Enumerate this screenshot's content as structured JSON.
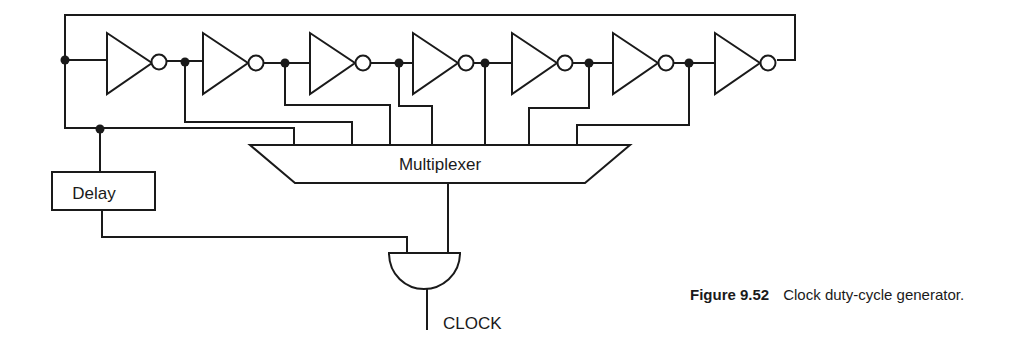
{
  "diagram": {
    "title": "Clock duty-cycle generator",
    "components": {
      "inverter_count": 7,
      "multiplexer_label": "Multiplexer",
      "delay_label": "Delay",
      "and_gate_output_label": "CLOCK"
    },
    "connections": [
      "Ring oscillator of 7 inverters with feedback from last output to first input",
      "Taps after each inverter stage feed multiplexer inputs",
      "Ring input node feeds Delay block",
      "Delay output and Multiplexer output feed AND gate",
      "AND gate output is CLOCK"
    ]
  },
  "caption": {
    "figure_number": "Figure 9.52",
    "text": "Clock duty-cycle generator."
  }
}
